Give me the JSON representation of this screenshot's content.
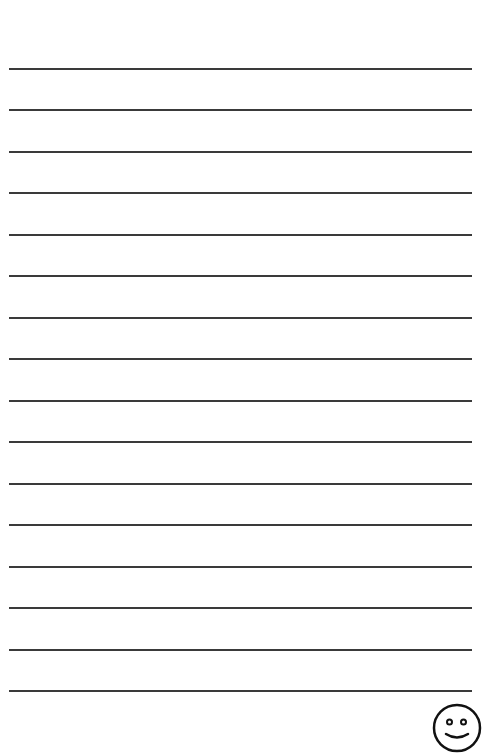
{
  "page": {
    "type": "lined-writing-paper",
    "background_color": "#ffffff",
    "line_color": "#3a3a3a",
    "line_count": 16,
    "line_positions_y": [
      69,
      110,
      152,
      193,
      235,
      276,
      318,
      359,
      401,
      442,
      484,
      525,
      567,
      608,
      650,
      691
    ]
  },
  "decoration": {
    "icon": "smiley-face-icon"
  }
}
